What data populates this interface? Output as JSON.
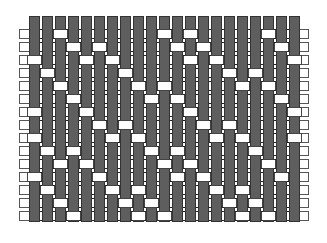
{
  "diagram": {
    "type": "woven-pattern",
    "colors": {
      "warp": "#5e5e5e",
      "warp_border": "#333333",
      "weft": "#ffffff",
      "weft_border": "#444444",
      "background": "#ffffff"
    },
    "grid": {
      "columns": 21,
      "rows": 15,
      "x0": 29,
      "col_pitch": 13,
      "col_width": 11,
      "y0": 29,
      "row_pitch": 13,
      "row_height": 10,
      "warp_top": 16,
      "warp_bottom": 222,
      "weft_left": 19,
      "weft_right": 309
    },
    "weft_visible": [
      [
        2,
        10,
        12,
        18
      ],
      [
        3,
        5,
        11,
        13,
        19
      ],
      [
        0,
        4,
        6,
        12,
        14,
        20
      ],
      [
        1,
        7,
        15,
        17
      ],
      [
        2,
        8,
        10,
        16,
        18
      ],
      [
        3,
        9,
        11,
        19
      ],
      [
        0,
        4,
        12,
        20
      ],
      [
        5,
        7,
        13,
        15
      ],
      [
        0,
        6,
        8,
        14,
        16,
        20
      ],
      [
        1,
        3,
        9,
        11,
        17
      ],
      [
        2,
        4,
        10,
        12,
        18
      ],
      [
        0,
        5,
        11,
        13,
        19
      ],
      [
        1,
        6,
        8,
        14,
        16
      ],
      [
        2,
        7,
        9,
        15,
        17
      ],
      [
        3,
        8,
        10,
        16,
        18
      ]
    ]
  }
}
